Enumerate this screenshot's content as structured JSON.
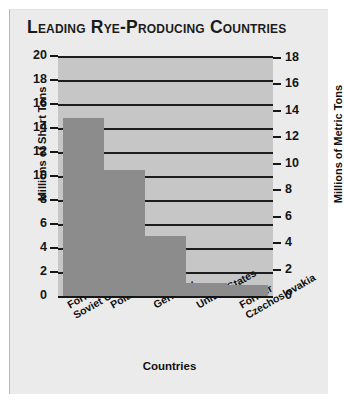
{
  "figure": {
    "title": "Leading Rye-Producing Countries",
    "background_color": "#ebebeb",
    "plot_background_color": "#c6c6c6",
    "bar_color": "#8c8c8c",
    "axis_color": "#171717"
  },
  "chart_data": {
    "type": "bar",
    "title": "Leading Rye-Producing Countries",
    "categories": [
      "Former\nSoviet Union",
      "Poland",
      "Germany",
      "United States",
      "Former\nCzechoslovakia"
    ],
    "values": [
      14.8,
      10.5,
      5.0,
      1.1,
      0.9
    ],
    "xlabel": "Countries",
    "ylabel": "Millions of Short Tons",
    "ylabel_secondary": "Millions of Metric Tons",
    "ylim": [
      0,
      20
    ],
    "ylim_secondary": [
      0,
      18
    ],
    "yticks": [
      0,
      2,
      4,
      6,
      8,
      10,
      12,
      14,
      16,
      18,
      20
    ],
    "yticks_secondary": [
      0,
      2,
      4,
      6,
      8,
      10,
      12,
      14,
      16,
      18
    ],
    "ytick_labels": [
      "0",
      "2",
      "4",
      "6",
      "8",
      "10",
      "12",
      "14",
      "16",
      "18",
      "20"
    ],
    "ytick_labels_secondary": [
      "0",
      "2",
      "4",
      "6",
      "8",
      "10",
      "12",
      "14",
      "16",
      "18"
    ],
    "grid": true,
    "grid_axis": "y",
    "legend": false
  }
}
